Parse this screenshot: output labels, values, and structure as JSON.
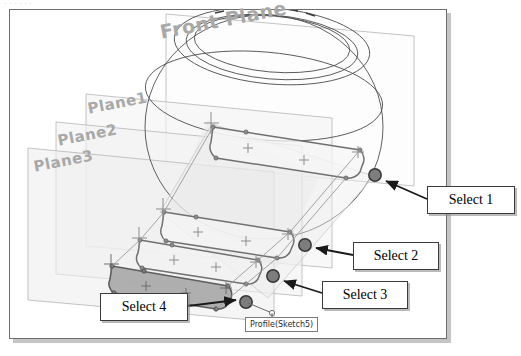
{
  "scan": {
    "top_strip_artifact": "······"
  },
  "viewport": {
    "name": "cad-graphics-viewport"
  },
  "plane_labels": [
    {
      "id": "front-plane",
      "text": "Front Plane"
    },
    {
      "id": "plane-1",
      "text": "Plane1"
    },
    {
      "id": "plane-2",
      "text": "Plane2"
    },
    {
      "id": "plane-3",
      "text": "Plane3"
    }
  ],
  "callouts": [
    {
      "id": "select-1",
      "label": "Select 1"
    },
    {
      "id": "select-2",
      "label": "Select 2"
    },
    {
      "id": "select-3",
      "label": "Select 3"
    },
    {
      "id": "select-4",
      "label": "Select 4"
    }
  ],
  "tooltip": {
    "text": "Profile(Sketch5)"
  },
  "colors": {
    "frame_border": "#6d6d6d",
    "frame_shadow": "#969696",
    "plane_label_text": "#a8a8a8",
    "plane_outline": "#b4b4b4",
    "plane_fill": "#f2f2f2",
    "sphere_wireframe": "#4a4a4a",
    "sketch_profile_line": "#6a6a6a",
    "selected_profile_fill": "#a3a3a3",
    "selection_point": "#7d7d7d",
    "selection_point_border": "#3c3c3c",
    "callout_border": "#3a3a3a",
    "callout_text": "#000000",
    "leader_arrow": "#1a1a1a",
    "tooltip_border": "#7a7a7a",
    "tooltip_text": "#2b2b2b",
    "background": "#ffffff"
  },
  "geometry": {
    "sphere": {
      "name": "revolved-sphere-wireframe",
      "silhouette_cx": 264,
      "silhouette_cy": 125,
      "silhouette_rx": 118,
      "silhouette_ry": 110,
      "top_ellipses": 3
    },
    "planes": [
      {
        "id": "front-plane-rect",
        "points": "166,14 414,36 414,186 166,164"
      },
      {
        "id": "plane-1-rect",
        "points": "86,94 332,118 332,268 86,246"
      },
      {
        "id": "plane-2-rect",
        "points": "56,122 302,146 302,296 56,274"
      },
      {
        "id": "plane-3-rect",
        "points": "28,148 274,172 274,322 28,300"
      }
    ],
    "profiles": [
      {
        "id": "profile-1",
        "selected": false,
        "note": "upper rounded-slot sketch on Front Plane"
      },
      {
        "id": "profile-2",
        "selected": false,
        "note": "middle rounded-slot sketch on Plane1"
      },
      {
        "id": "profile-3",
        "selected": false,
        "note": "lower rounded-slot sketch on Plane2"
      },
      {
        "id": "profile-4",
        "selected": true,
        "note": "bottom rounded-slot sketch on Plane3, shaded/selected"
      }
    ],
    "selection_points": [
      {
        "id": "select-point-1",
        "x": 375,
        "y": 175,
        "r": 6
      },
      {
        "id": "select-point-2",
        "x": 305,
        "y": 245,
        "r": 6
      },
      {
        "id": "select-point-3",
        "x": 273,
        "y": 276,
        "r": 6
      },
      {
        "id": "select-point-4",
        "x": 246,
        "y": 302,
        "r": 6
      }
    ],
    "leader_lines": [
      {
        "id": "leader-1",
        "from": [
          427,
          198
        ],
        "to": [
          383,
          180
        ]
      },
      {
        "id": "leader-2",
        "from": [
          353,
          254
        ],
        "to": [
          314,
          248
        ]
      },
      {
        "id": "leader-3",
        "from": [
          322,
          292
        ],
        "to": [
          282,
          280
        ]
      },
      {
        "id": "leader-4",
        "from": [
          188,
          305
        ],
        "to": [
          238,
          302
        ]
      }
    ],
    "tooltip_anchor": {
      "x": 272,
      "y": 311
    }
  }
}
